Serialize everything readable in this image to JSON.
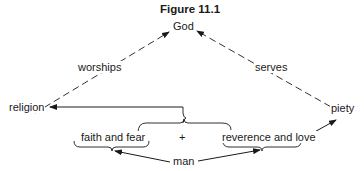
{
  "figure": {
    "title": "Figure 11.1",
    "nodes": {
      "god": "God",
      "religion": "religion",
      "piety": "piety",
      "faith_and_fear": "faith and fear",
      "plus": "+",
      "reverence_and_love": "reverence and love",
      "man": "man"
    },
    "edges": {
      "worships": "worships",
      "serves": "serves"
    },
    "colors": {
      "line": "#1a1a1a",
      "background": "#ffffff"
    }
  }
}
